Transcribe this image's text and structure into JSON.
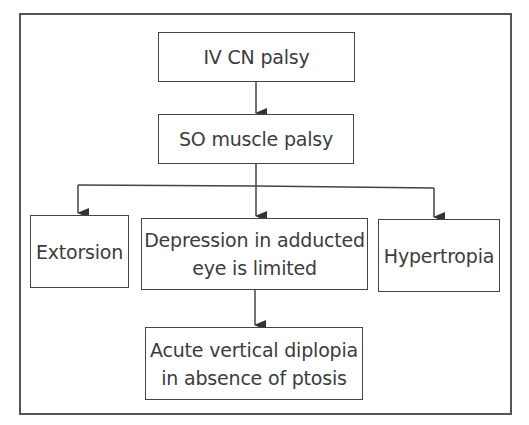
{
  "diagram": {
    "type": "flowchart",
    "nodes": [
      {
        "id": "iv_cn_palsy",
        "label": "IV CN palsy"
      },
      {
        "id": "so_muscle_palsy",
        "label": "SO muscle palsy"
      },
      {
        "id": "extorsion",
        "label": "Extorsion"
      },
      {
        "id": "depression_limited",
        "label_line1": "Depression in adducted",
        "label_line2": "eye is limited"
      },
      {
        "id": "hypertropia",
        "label": "Hypertropia"
      },
      {
        "id": "acute_diplopia",
        "label_line1": "Acute vertical diplopia",
        "label_line2": "in absence of ptosis"
      }
    ],
    "edges": [
      {
        "from": "iv_cn_palsy",
        "to": "so_muscle_palsy"
      },
      {
        "from": "so_muscle_palsy",
        "to": "extorsion"
      },
      {
        "from": "so_muscle_palsy",
        "to": "depression_limited"
      },
      {
        "from": "so_muscle_palsy",
        "to": "hypertropia"
      },
      {
        "from": "depression_limited",
        "to": "acute_diplopia"
      }
    ],
    "colors": {
      "line": "#444444",
      "text": "#3c3c3c",
      "background": "#ffffff"
    }
  }
}
